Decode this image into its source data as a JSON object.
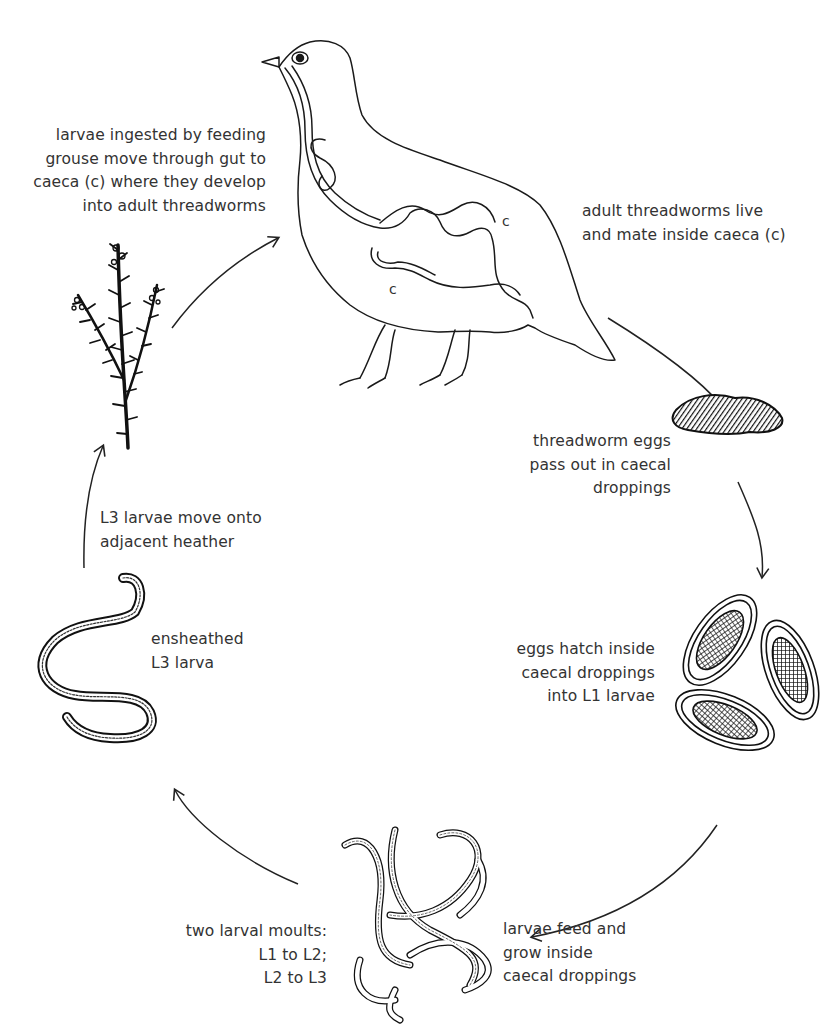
{
  "diagram": {
    "stages": [
      {
        "id": "ingestion",
        "lines": [
          "larvae ingested by feeding",
          "grouse move through gut to",
          "caeca (c) where they develop",
          "into adult threadworms"
        ]
      },
      {
        "id": "adults",
        "lines": [
          "adult threadworms live",
          "and mate inside caeca (c)"
        ]
      },
      {
        "id": "eggs-out",
        "lines": [
          "threadworm eggs",
          "pass out in caecal",
          "droppings"
        ]
      },
      {
        "id": "hatch",
        "lines": [
          "eggs hatch inside",
          "caecal droppings",
          "into L1 larvae"
        ]
      },
      {
        "id": "feed-grow",
        "lines": [
          "larvae feed and",
          "grow inside",
          "caecal droppings"
        ]
      },
      {
        "id": "moults",
        "lines": [
          "two larval moults:",
          "L1 to L2;",
          "L2 to L3"
        ]
      },
      {
        "id": "ensheathed",
        "lines": [
          "ensheathed",
          "L3 larva"
        ]
      },
      {
        "id": "migrate",
        "lines": [
          "L3 larvae move onto",
          "adjacent heather"
        ]
      }
    ],
    "caeca_marker": "c",
    "illustrations": [
      "grouse-with-gut",
      "caecal-dropping",
      "eggs-in-dropping",
      "larvae-cluster",
      "ensheathed-larva",
      "heather-sprig"
    ]
  }
}
